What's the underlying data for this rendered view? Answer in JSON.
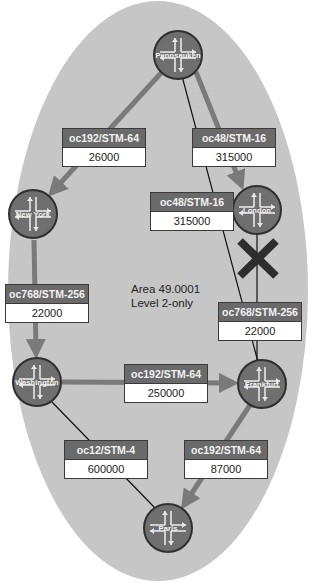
{
  "diagram": {
    "area": {
      "line1": "Area 49.0001",
      "line2": "Level 2-only"
    },
    "colors": {
      "area_fill": "#c6c6c6",
      "router_fill": "#6f6f6f",
      "router_border": "#2f2f2f",
      "link_thick": "#7a7a7a",
      "link_thin": "#111111",
      "label_header": "#6a6a6a",
      "label_body": "#ffffff",
      "failure_mark": "#2e2e2e"
    },
    "routers": [
      {
        "name": "Pennsauken"
      },
      {
        "name": "New York"
      },
      {
        "name": "London"
      },
      {
        "name": "Washington"
      },
      {
        "name": "Frankfurt"
      },
      {
        "name": "Paris"
      }
    ],
    "links": [
      {
        "from": "Pennsauken",
        "to": "New York",
        "type": "oc192/STM-64",
        "metric": "26000"
      },
      {
        "from": "Pennsauken",
        "to": "London",
        "type": "oc48/STM-16",
        "metric": "315000"
      },
      {
        "from": "Pennsauken",
        "to": "Frankfurt",
        "type": "oc48/STM-16",
        "metric": "315000"
      },
      {
        "from": "New York",
        "to": "Washington",
        "type": "oc768/STM-256",
        "metric": "22000"
      },
      {
        "from": "London",
        "to": "Frankfurt",
        "type": "oc768/STM-256",
        "metric": "22000",
        "status": "failed"
      },
      {
        "from": "Washington",
        "to": "Frankfurt",
        "type": "oc192/STM-64",
        "metric": "250000"
      },
      {
        "from": "Washington",
        "to": "Paris",
        "type": "oc12/STM-4",
        "metric": "600000"
      },
      {
        "from": "Frankfurt",
        "to": "Paris",
        "type": "oc192/STM-64",
        "metric": "87000"
      }
    ],
    "failure_icon": "x-mark-icon"
  }
}
